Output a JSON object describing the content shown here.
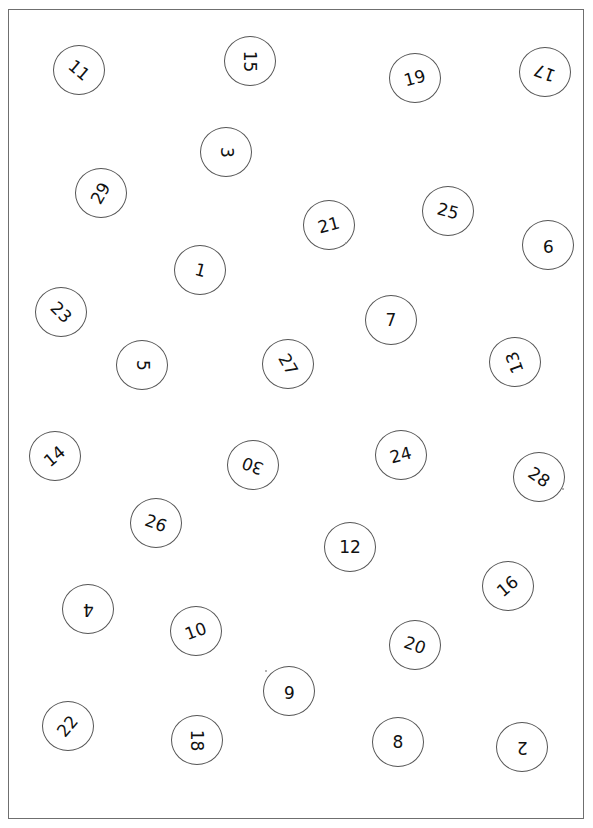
{
  "worksheet": {
    "description": "Scattered numbered circles 1-30 on a bordered sheet",
    "border_color": "#6f6f6f",
    "circle_border_color": "#555555",
    "text_color": "#111111",
    "circles": [
      {
        "label": "11",
        "x": 79,
        "y": 70,
        "rotate": 40
      },
      {
        "label": "15",
        "x": 250,
        "y": 61,
        "rotate": 90
      },
      {
        "label": "19",
        "x": 415,
        "y": 78,
        "rotate": -15
      },
      {
        "label": "17",
        "x": 545,
        "y": 72,
        "rotate": 200
      },
      {
        "label": "3",
        "x": 226,
        "y": 152,
        "rotate": 90
      },
      {
        "label": "29",
        "x": 101,
        "y": 193,
        "rotate": -60
      },
      {
        "label": "21",
        "x": 329,
        "y": 225,
        "rotate": -15
      },
      {
        "label": "25",
        "x": 448,
        "y": 211,
        "rotate": 15
      },
      {
        "label": "9",
        "x": 548,
        "y": 245,
        "rotate": 180
      },
      {
        "label": "1",
        "x": 200,
        "y": 270,
        "rotate": 15
      },
      {
        "label": "23",
        "x": 61,
        "y": 312,
        "rotate": 45
      },
      {
        "label": "7",
        "x": 391,
        "y": 320,
        "rotate": 0
      },
      {
        "label": "5",
        "x": 142,
        "y": 365,
        "rotate": 90
      },
      {
        "label": "27",
        "x": 288,
        "y": 364,
        "rotate": 60
      },
      {
        "label": "13",
        "x": 515,
        "y": 362,
        "rotate": 250
      },
      {
        "label": "14",
        "x": 55,
        "y": 456,
        "rotate": -40
      },
      {
        "label": "30",
        "x": 253,
        "y": 465,
        "rotate": 200
      },
      {
        "label": "24",
        "x": 401,
        "y": 455,
        "rotate": -15
      },
      {
        "label": "28",
        "x": 539,
        "y": 477,
        "rotate": 35
      },
      {
        "label": "26",
        "x": 156,
        "y": 523,
        "rotate": 20
      },
      {
        "label": "12",
        "x": 350,
        "y": 547,
        "rotate": 0
      },
      {
        "label": "16",
        "x": 508,
        "y": 586,
        "rotate": -40
      },
      {
        "label": "4",
        "x": 88,
        "y": 609,
        "rotate": 180
      },
      {
        "label": "10",
        "x": 196,
        "y": 631,
        "rotate": -20
      },
      {
        "label": "20",
        "x": 415,
        "y": 645,
        "rotate": 20
      },
      {
        "label": "6",
        "x": 289,
        "y": 691,
        "rotate": 180
      },
      {
        "label": "22",
        "x": 68,
        "y": 726,
        "rotate": -50
      },
      {
        "label": "18",
        "x": 197,
        "y": 740,
        "rotate": 90
      },
      {
        "label": "8",
        "x": 398,
        "y": 742,
        "rotate": 0
      },
      {
        "label": "2",
        "x": 522,
        "y": 747,
        "rotate": 180
      }
    ]
  }
}
